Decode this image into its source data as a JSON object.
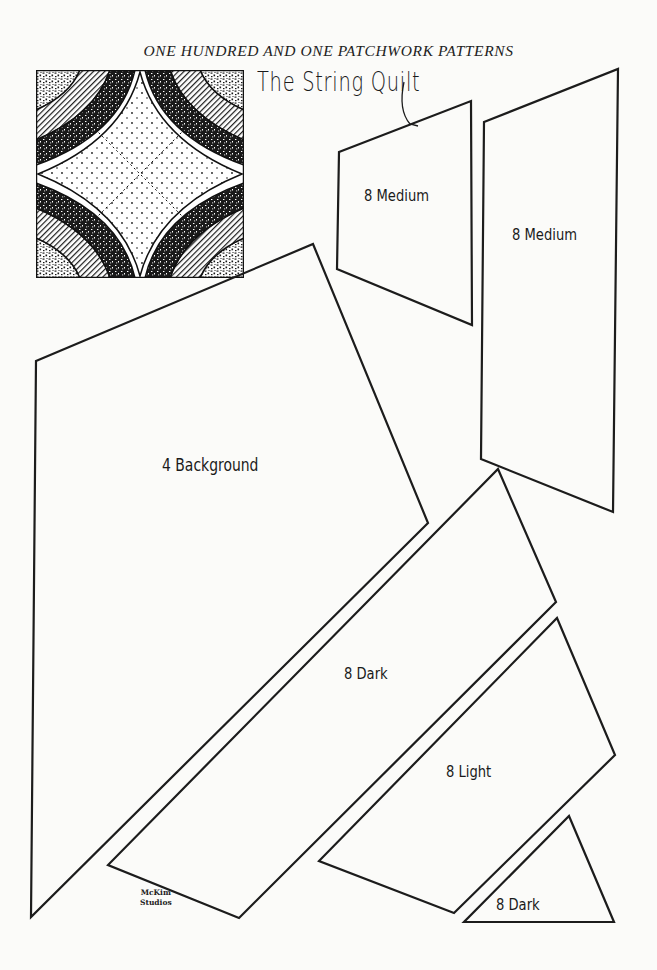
{
  "header": {
    "running_title": "ONE HUNDRED AND ONE PATCHWORK PATTERNS"
  },
  "pattern": {
    "title": "The String Quilt",
    "block_illustration": "string-quilt-block-diagram"
  },
  "pieces": [
    {
      "id": "medium-a",
      "label": "8 Medium",
      "count": 8,
      "fabric": "Medium",
      "shape": "quadrilateral",
      "points": "339,152 471,101 472,325 337,269"
    },
    {
      "id": "medium-b",
      "label": "8 Medium",
      "count": 8,
      "fabric": "Medium",
      "shape": "quadrilateral",
      "points": "484,122 618,69 613,512 481,459"
    },
    {
      "id": "background",
      "label": "4 Background",
      "count": 4,
      "fabric": "Background",
      "shape": "quadrilateral",
      "points": "36,361 313,244 428,523 31,917"
    },
    {
      "id": "dark-a",
      "label": "8 Dark",
      "count": 8,
      "fabric": "Dark",
      "shape": "quadrilateral",
      "points": "498,469 556,602 239,918 108,865"
    },
    {
      "id": "light",
      "label": "8 Light",
      "count": 8,
      "fabric": "Light",
      "shape": "quadrilateral",
      "points": "557,618 615,755 454,913 319,861"
    },
    {
      "id": "dark-b",
      "label": "8 Dark",
      "count": 8,
      "fabric": "Dark",
      "shape": "triangle",
      "points": "569,816 614,922 464,922"
    }
  ],
  "signature": {
    "line1": "McKim",
    "line2": "Studios"
  },
  "colors": {
    "paper": "#fbfbf9",
    "ink": "#1c1c1c"
  }
}
